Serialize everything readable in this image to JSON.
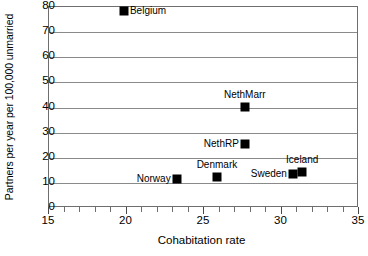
{
  "chart_data": {
    "type": "scatter",
    "title": "",
    "xlabel": "Cohabitation rate",
    "ylabel": "Partners per year per 100,000 unmarried",
    "xlim": [
      15,
      35
    ],
    "ylim": [
      0,
      80
    ],
    "xticks": [
      15,
      20,
      25,
      30,
      35
    ],
    "xticklabels": [
      "15",
      "20",
      "25",
      "30",
      "35"
    ],
    "x_minor_tick_step": 1,
    "yticks": [
      0,
      10,
      20,
      30,
      40,
      50,
      60,
      70,
      80
    ],
    "yticklabels": [
      "0",
      "10",
      "20",
      "30",
      "40",
      "50",
      "60",
      "70",
      "80"
    ],
    "grid": "horizontal",
    "legend": "none",
    "marker_color": "#000000",
    "marker_shape": "square",
    "points": [
      {
        "label": "Belgium",
        "x": 19.9,
        "y": 78.0,
        "label_pos": "right"
      },
      {
        "label": "NethMarr",
        "x": 27.7,
        "y": 40.0,
        "label_pos": "above"
      },
      {
        "label": "NethRP",
        "x": 27.7,
        "y": 25.0,
        "label_pos": "left"
      },
      {
        "label": "Denmark",
        "x": 25.9,
        "y": 12.0,
        "label_pos": "above"
      },
      {
        "label": "Norway",
        "x": 23.3,
        "y": 11.0,
        "label_pos": "left"
      },
      {
        "label": "Sweden",
        "x": 30.8,
        "y": 13.0,
        "label_pos": "left"
      },
      {
        "label": "Iceland",
        "x": 31.4,
        "y": 14.0,
        "label_pos": "above"
      }
    ]
  }
}
